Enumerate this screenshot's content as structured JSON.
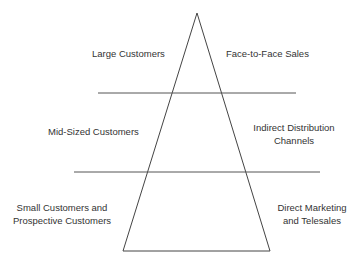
{
  "diagram": {
    "type": "pyramid",
    "left_labels": [
      "Large Customers",
      "Mid-Sized Customers",
      "Small Customers and\nProspective Customers"
    ],
    "right_labels": [
      "Face-to-Face Sales",
      "Indirect Distribution\nChannels",
      "Direct Marketing\nand Telesales"
    ],
    "tiers": [
      {
        "customer": "Large Customers",
        "channel": "Face-to-Face Sales"
      },
      {
        "customer": "Mid-Sized Customers",
        "channel": "Indirect Distribution Channels"
      },
      {
        "customer": "Small Customers and Prospective Customers",
        "channel": "Direct Marketing and Telesales"
      }
    ],
    "colors": {
      "line": "#444444",
      "text": "#333333",
      "background": "#ffffff"
    }
  },
  "labels": {
    "large": "Large Customers",
    "f2f": "Face-to-Face Sales",
    "mid": "Mid-Sized Customers",
    "indirect_1": "Indirect Distribution",
    "indirect_2": "Channels",
    "small_1": "Small Customers and",
    "small_2": "Prospective Customers",
    "direct_1": "Direct Marketing",
    "direct_2": "and Telesales"
  }
}
